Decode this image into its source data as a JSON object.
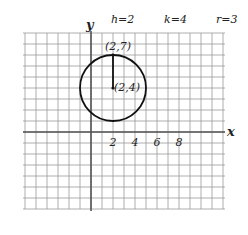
{
  "header": {
    "h_label": "h=2",
    "k_label": "k=4",
    "r_label": "r=3"
  },
  "axes": {
    "x_label": "x",
    "y_label": "y",
    "x_ticks": [
      "2",
      "4",
      "6",
      "8"
    ],
    "x_tick_values": [
      2,
      4,
      6,
      8
    ],
    "xlim": [
      -6,
      12
    ],
    "ylim": [
      -7,
      9
    ]
  },
  "circle": {
    "center": [
      2,
      4
    ],
    "radius": 3,
    "center_label": "(2,4)",
    "top_point_label": "(2,7)",
    "top_point": [
      2,
      7
    ]
  },
  "colors": {
    "grid": "#9a9a9a",
    "axis": "#555555",
    "curve": "#111111"
  }
}
